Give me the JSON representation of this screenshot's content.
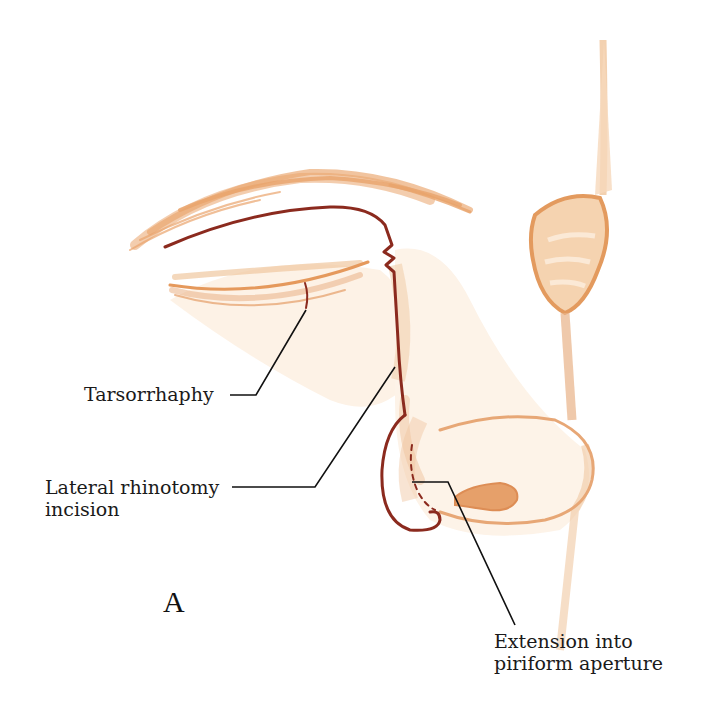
{
  "figure": {
    "panel_letter": "A",
    "labels": {
      "tarsorrhaphy": "Tarsorrhaphy",
      "lateral_rhinotomy_line1": "Lateral rhinotomy",
      "lateral_rhinotomy_line2": "incision",
      "extension_line1": "Extension into",
      "extension_line2": "piriform aperture"
    },
    "colors": {
      "skin_shade": "#e8a46a",
      "skin_light": "#f7dcc0",
      "incision": "#8b2a1e",
      "leader_line": "#111111"
    }
  }
}
